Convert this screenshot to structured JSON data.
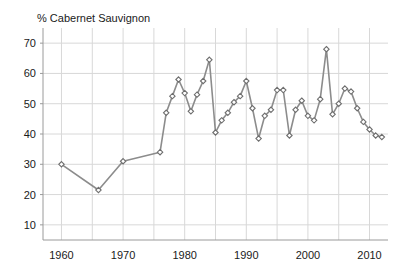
{
  "chart_data": {
    "type": "line",
    "title": "% Cabernet Sauvignon",
    "xlabel": "",
    "ylabel": "% Cabernet Sauvignon",
    "xlim": [
      1957,
      2013
    ],
    "ylim": [
      5,
      75
    ],
    "yticks": [
      10,
      20,
      30,
      40,
      50,
      60,
      70
    ],
    "xticks": [
      1960,
      1970,
      1980,
      1990,
      2000,
      2010
    ],
    "x_gridlines": [
      1960,
      1965,
      1970,
      1975,
      1980,
      1985,
      1990,
      1995,
      2000,
      2005,
      2010
    ],
    "grid": true,
    "legend": "none",
    "marker": "diamond",
    "line_color": "#8c8c8c",
    "marker_fill": "#ffffff",
    "marker_edge": "#6e6e6e",
    "grid_color": "#d8d8d8",
    "axis_color": "#9a9a9a",
    "text_color": "#1a1a1a",
    "series": [
      {
        "name": "% Cabernet Sauvignon",
        "x": [
          1960,
          1966,
          1970,
          1976,
          1977,
          1978,
          1979,
          1980,
          1981,
          1982,
          1983,
          1984,
          1985,
          1986,
          1987,
          1988,
          1989,
          1990,
          1991,
          1992,
          1993,
          1994,
          1995,
          1996,
          1997,
          1998,
          1999,
          2000,
          2001,
          2002,
          2003,
          2004,
          2005,
          2006,
          2007,
          2008,
          2009,
          2010,
          2011,
          2012
        ],
        "values": [
          30,
          21.5,
          31,
          34,
          47,
          52.5,
          58,
          53.5,
          47.5,
          53,
          57.5,
          64.5,
          40.5,
          44.5,
          47,
          50.5,
          52.5,
          57.5,
          48.5,
          38.5,
          46,
          48,
          54.5,
          54.5,
          39.5,
          48,
          51,
          46,
          44.5,
          51.5,
          68,
          46.5,
          50,
          55,
          54,
          48.5,
          44,
          41.5,
          39.5,
          39
        ]
      }
    ]
  }
}
